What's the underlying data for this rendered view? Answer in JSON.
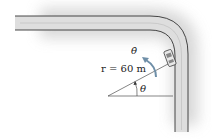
{
  "diagram": {
    "type": "road curve with car and polar coordinates",
    "labels": {
      "radius": "r = 60 m",
      "theta": "θ",
      "theta_dot": "θ̇"
    },
    "colors": {
      "road_fill": "#dcdcdc",
      "road_edge": "#333333",
      "shadow": "#cfcfcf",
      "arrow": "#6f8fa8",
      "line": "#333333"
    }
  }
}
